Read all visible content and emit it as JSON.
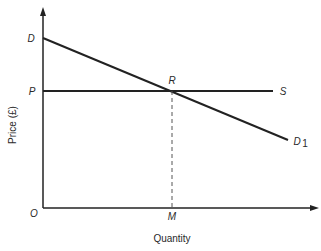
{
  "diagram": {
    "axes": {
      "y_label": "Price (£)",
      "x_label": "Quantity",
      "origin_label": "O"
    },
    "points": {
      "demand_intercept": "D",
      "price_level": "P",
      "intersection": "R",
      "supply_label": "S",
      "demand_label": "D",
      "demand_subscript": "1",
      "quantity_point": "M"
    },
    "colors": {
      "line": "#222222",
      "text": "#2a2a2a"
    }
  }
}
